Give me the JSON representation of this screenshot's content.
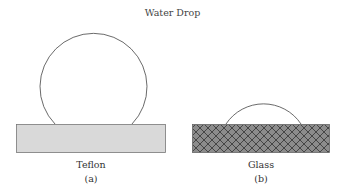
{
  "title": "Water Drop",
  "panels": [
    {
      "label": "Teflon",
      "sub": "(a)",
      "surface_fill": "#d9d9d9",
      "pattern": "stippled"
    },
    {
      "label": "Glass",
      "sub": "(b)",
      "surface_fill": "#8c8c8c",
      "pattern": "crosshatch"
    }
  ]
}
